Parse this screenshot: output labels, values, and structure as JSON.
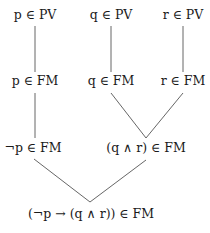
{
  "diagram": {
    "line_color": "#555555",
    "nodes": [
      {
        "id": "p_pv",
        "label": "p ∈ PV",
        "x": 35,
        "y": 15
      },
      {
        "id": "q_pv",
        "label": "q ∈ PV",
        "x": 111,
        "y": 15
      },
      {
        "id": "r_pv",
        "label": "r ∈ PV",
        "x": 183,
        "y": 15
      },
      {
        "id": "p_fm",
        "label": "p ∈ FM",
        "x": 35,
        "y": 81
      },
      {
        "id": "q_fm",
        "label": "q ∈ FM",
        "x": 111,
        "y": 81
      },
      {
        "id": "r_fm",
        "label": "r ∈ FM",
        "x": 183,
        "y": 81
      },
      {
        "id": "notp_fm",
        "label": "¬p ∈ FM",
        "x": 33,
        "y": 148
      },
      {
        "id": "qandr_fm",
        "label": "(q ∧ r) ∈ FM",
        "x": 146,
        "y": 148
      },
      {
        "id": "impl_fm",
        "label": "(¬p → (q ∧ r)) ∈ FM",
        "x": 91,
        "y": 214
      }
    ],
    "edges": [
      {
        "from": "p_pv",
        "to": "p_fm"
      },
      {
        "from": "q_pv",
        "to": "q_fm"
      },
      {
        "from": "r_pv",
        "to": "r_fm"
      },
      {
        "from": "p_fm",
        "to": "notp_fm"
      },
      {
        "from": "q_fm",
        "to": "qandr_fm"
      },
      {
        "from": "r_fm",
        "to": "qandr_fm"
      },
      {
        "from": "notp_fm",
        "to": "impl_fm"
      },
      {
        "from": "qandr_fm",
        "to": "impl_fm"
      }
    ]
  }
}
